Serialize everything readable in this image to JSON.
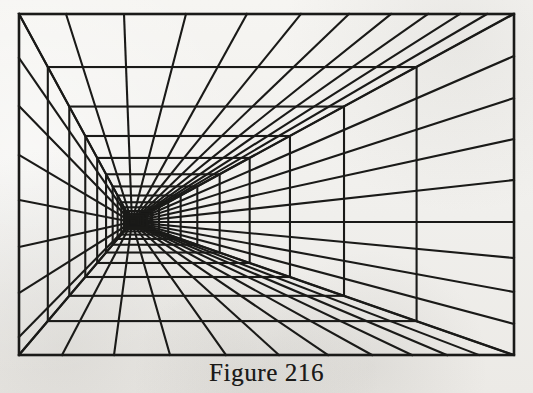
{
  "figure": {
    "caption": "Figure 216",
    "media": "line drawing, black ink on off-white paper"
  },
  "colors": {
    "paper": "#f0efec",
    "ink": "#1a1a18",
    "caption_ink": "#1b1a18",
    "page": "#ffffff"
  },
  "geometry": {
    "canvas": {
      "width": 533,
      "height": 393
    },
    "outer_rect": {
      "x": 19,
      "y": 14,
      "width": 495,
      "height": 341
    },
    "vanishing_point": {
      "x": 132,
      "y": 222
    },
    "stroke_width_outer": 2.6,
    "stroke_width_ray": 2.1,
    "stroke_width_rect": 2.1,
    "nested_rect_count": 17,
    "nested_rect_ratio": 0.745,
    "ray_count_top": 12,
    "ray_count_bottom": 12,
    "ray_count_left": 6,
    "ray_count_right": 7,
    "ray_total": 37
  },
  "chart_data": {
    "type": "diagram",
    "title": "Figure 216",
    "subtype": "one-point perspective grid",
    "vanishing_point": [
      132,
      222
    ],
    "frame": [
      19,
      14,
      514,
      355
    ],
    "rays": {
      "count": 37,
      "note": "straight lines radiating from the vanishing point to the outer rectangle border",
      "edge_hits_top_x": [
        19,
        66,
        124,
        186,
        247,
        301,
        349,
        391,
        428,
        460,
        487,
        513
      ],
      "edge_hits_bottom_x": [
        19,
        62,
        114,
        170,
        226,
        279,
        328,
        372,
        412,
        447,
        479,
        513
      ],
      "edge_hits_left_y": [
        14,
        58,
        106,
        155,
        200,
        247,
        293,
        337,
        355
      ],
      "edge_hits_right_y": [
        14,
        56,
        98,
        139,
        180,
        222,
        258,
        292,
        324,
        355
      ]
    },
    "nested_rectangles": {
      "count": 17,
      "note": "each rectangle is the outer rectangle scaled toward the vanishing point by a constant ratio",
      "scale_ratio": 0.745,
      "widths": [
        495,
        369,
        275,
        205,
        153,
        114,
        85,
        63,
        47,
        35,
        26,
        19,
        14,
        11,
        8,
        6,
        4
      ],
      "heights": [
        341,
        254,
        189,
        141,
        105,
        78,
        58,
        43,
        32,
        24,
        18,
        13,
        10,
        7,
        6,
        4,
        3
      ]
    }
  }
}
